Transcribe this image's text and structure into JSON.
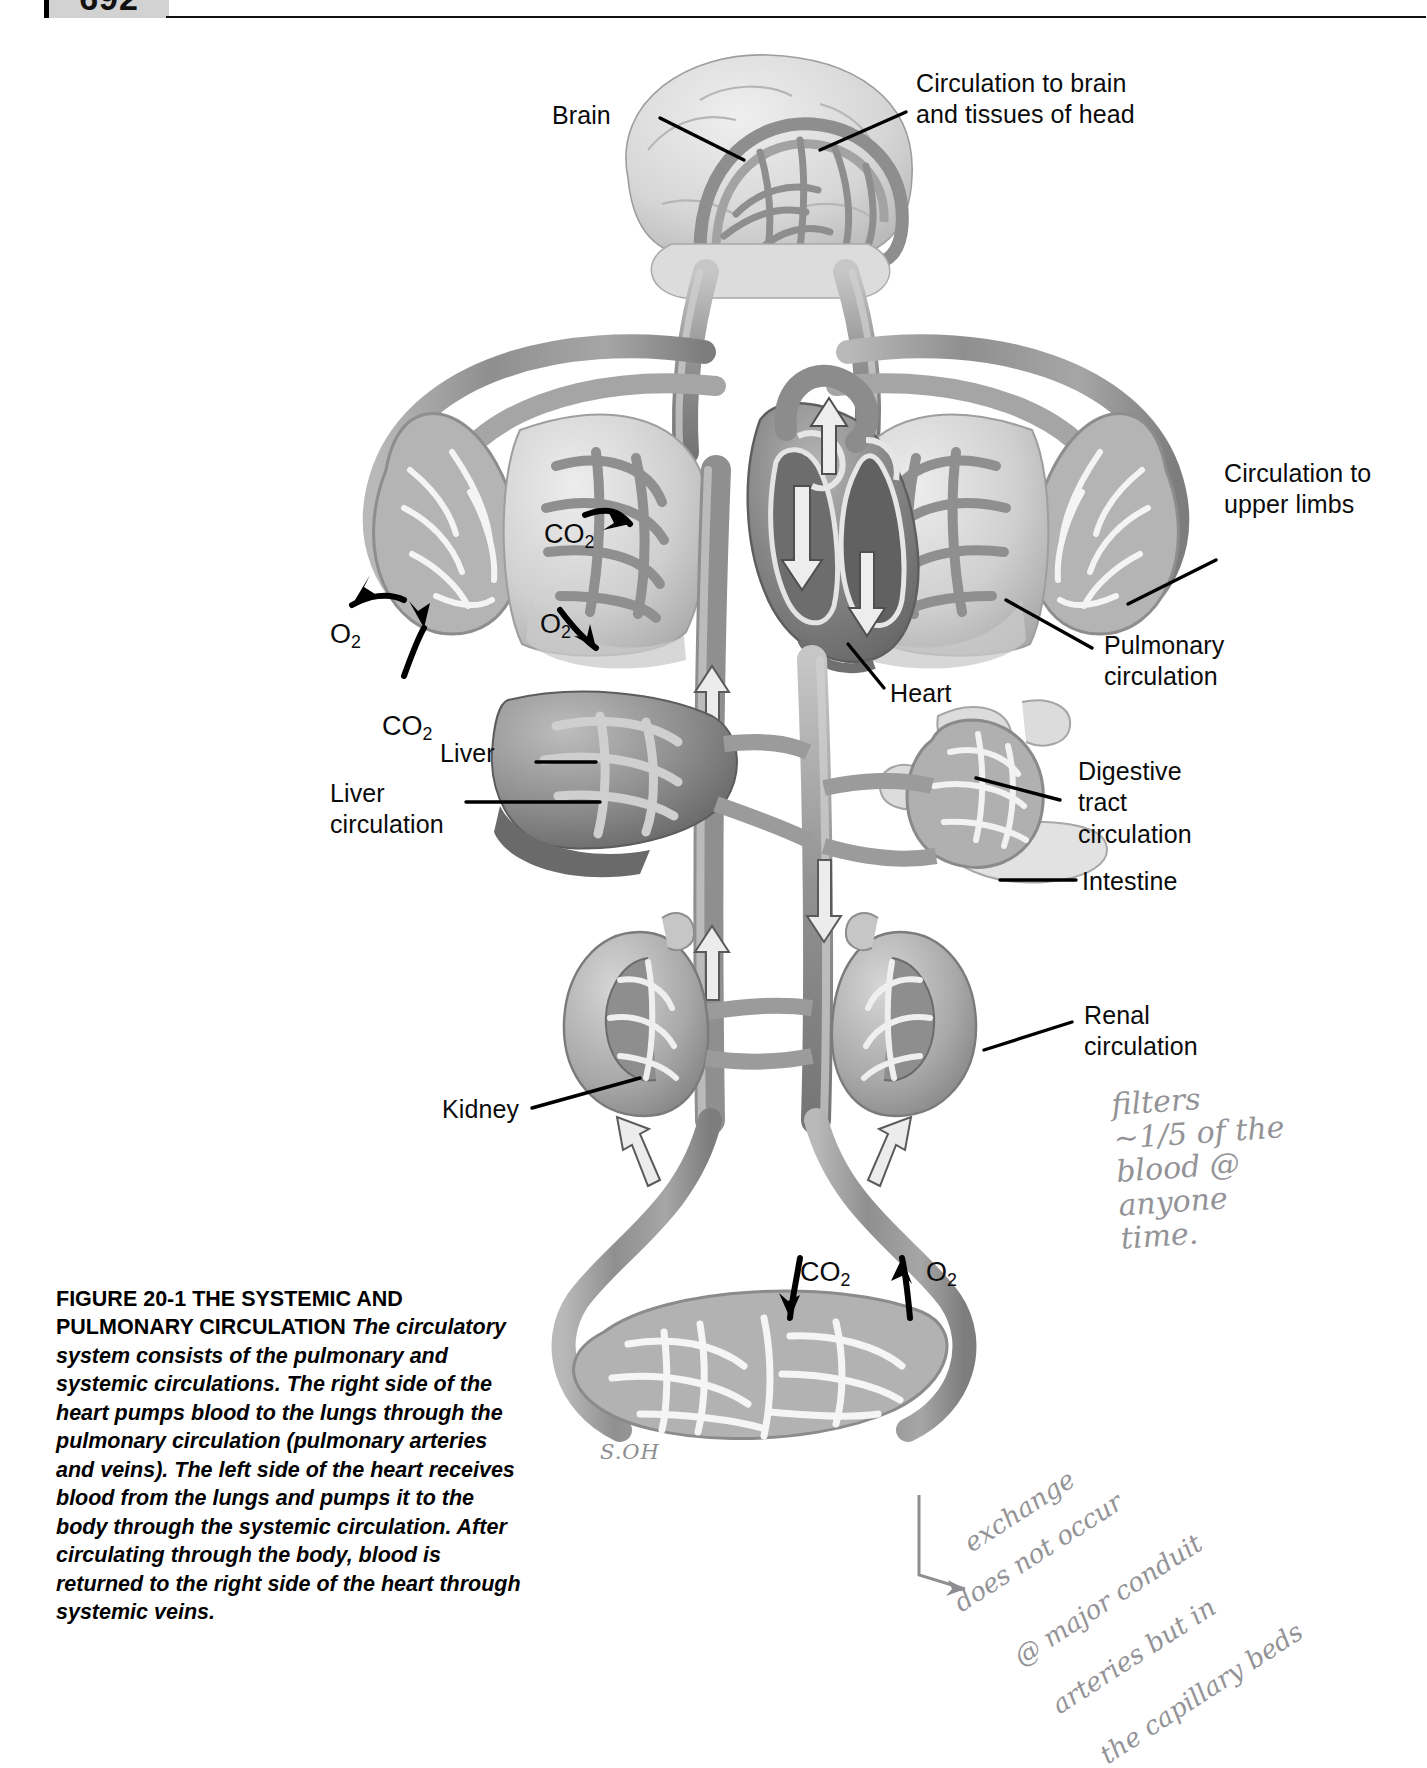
{
  "page": {
    "number": "692",
    "signature": "S.OH"
  },
  "figure": {
    "caption_heading": "FIGURE 20-1 THE SYSTEMIC AND PULMONARY CIRCULATION",
    "caption_body": " The circulatory system consists of the pulmonary and systemic circulations. The right side of the heart pumps blood to the lungs through the pulmonary circulation (pulmonary arteries and veins). The left side of the heart receives blood from the lungs and pumps it to the body through the systemic circulation. After circulating through the body, blood is returned to the right side of the heart through systemic veins."
  },
  "labels": {
    "brain": "Brain",
    "circulation_brain_head": "Circulation to brain\nand tissues of head",
    "circulation_upper_limbs": "Circulation to\nupper limbs",
    "pulmonary_circulation": "Pulmonary\ncirculation",
    "heart": "Heart",
    "liver": "Liver",
    "liver_circulation": "Liver\ncirculation",
    "digestive_tract_circulation": "Digestive\ntract\ncirculation",
    "intestine": "Intestine",
    "renal_circulation": "Renal\ncirculation",
    "kidney": "Kidney"
  },
  "gas_labels": {
    "co2_lung_left": "CO",
    "co2_lung_left_sub": "2",
    "o2_lung_left": "O",
    "o2_lung_left_sub": "2",
    "o2_limb_left": "O",
    "o2_limb_left_sub": "2",
    "co2_limb_left": "CO",
    "co2_limb_left_sub": "2",
    "co2_bottom": "CO",
    "co2_bottom_sub": "2",
    "o2_bottom": "O",
    "o2_bottom_sub": "2"
  },
  "annotations": {
    "renal_note": "filters\n~1/5 of the\nblood @\nanyone\ntime.",
    "exchange_note_line1": "exchange",
    "exchange_note_line2": "does not occur",
    "exchange_note_line3": "@ major conduit",
    "exchange_note_line4": "arteries but in",
    "exchange_note_line5": "the capillary beds"
  },
  "colors": {
    "vessel_mid": "#9a9a9a",
    "vessel_dark": "#6f6f6f",
    "vessel_light": "#c2c2c2",
    "organ_light": "#d8d8d8",
    "organ_dark": "#8a8a8a",
    "ink": "#0b0b0b",
    "pencil": "#8e8e92",
    "tab_gray": "#d2d2d2"
  }
}
